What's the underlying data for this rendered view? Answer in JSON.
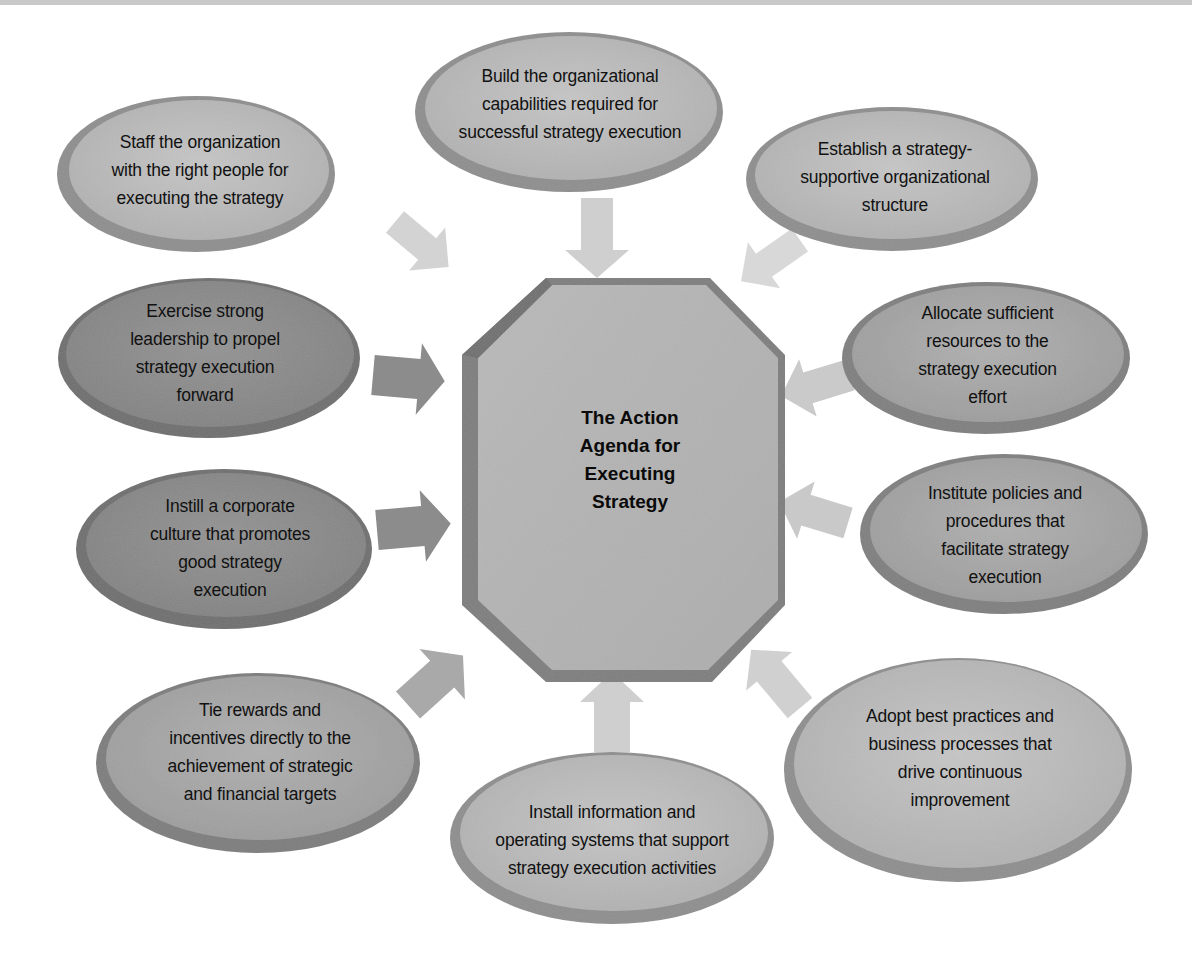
{
  "diagram": {
    "center": {
      "title": "The Action Agenda for Executing Strategy",
      "lines": [
        "The Action",
        "Agenda for",
        "Executing",
        "Strategy"
      ]
    },
    "nodes": [
      {
        "id": "staff",
        "lines": [
          "Staff the organization",
          "with the right people for",
          "executing the strategy"
        ],
        "shade": "light"
      },
      {
        "id": "capabilities",
        "lines": [
          "Build the organizational",
          "capabilities required for",
          "successful strategy execution"
        ],
        "shade": "light"
      },
      {
        "id": "structure",
        "lines": [
          "Establish a strategy-",
          "supportive organizational",
          "structure"
        ],
        "shade": "light"
      },
      {
        "id": "leadership",
        "lines": [
          "Exercise strong",
          "leadership to propel",
          "strategy execution",
          "forward"
        ],
        "shade": "dark"
      },
      {
        "id": "resources",
        "lines": [
          "Allocate sufficient",
          "resources to the",
          "strategy execution",
          "effort"
        ],
        "shade": "medium"
      },
      {
        "id": "culture",
        "lines": [
          "Instill a corporate",
          "culture that promotes",
          "good strategy",
          "execution"
        ],
        "shade": "dark"
      },
      {
        "id": "policies",
        "lines": [
          "Institute policies and",
          "procedures that",
          "facilitate strategy",
          "execution"
        ],
        "shade": "medium"
      },
      {
        "id": "rewards",
        "lines": [
          "Tie rewards and",
          "incentives directly to the",
          "achievement of strategic",
          "and financial targets"
        ],
        "shade": "medium"
      },
      {
        "id": "systems",
        "lines": [
          "Install information and",
          "operating systems that support",
          "strategy execution activities"
        ],
        "shade": "light"
      },
      {
        "id": "practices",
        "lines": [
          "Adopt best practices and",
          "business processes that",
          "drive continuous",
          "improvement"
        ],
        "shade": "light"
      }
    ],
    "colors": {
      "light_fill": "#b9b9b9",
      "light_rim": "#8c8c8c",
      "medium_fill": "#a6a6a6",
      "medium_rim": "#7d7d7d",
      "dark_fill": "#8a8a8a",
      "dark_rim": "#6a6a6a",
      "center_fill": "#b2b2b2",
      "center_rim": "#7a7a7a",
      "arrow_light": "#d6d6d6",
      "arrow_medium": "#bdbdbd",
      "arrow_dark": "#8e8e8e"
    }
  }
}
